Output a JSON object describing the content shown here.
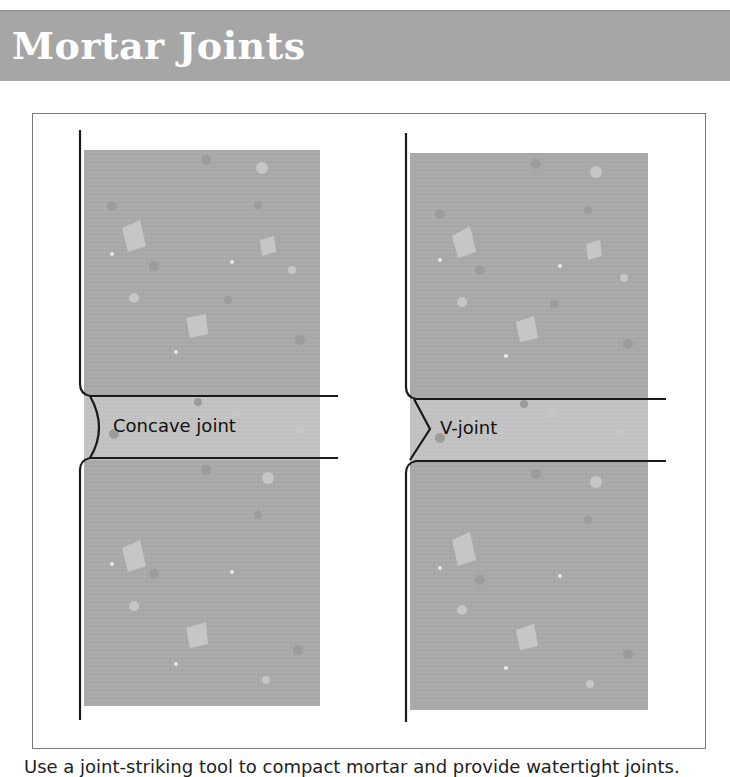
{
  "header": {
    "title": "Mortar Joints"
  },
  "diagram": {
    "joints": [
      {
        "label": "Concave joint",
        "shape": "concave"
      },
      {
        "label": "V-joint",
        "shape": "v"
      }
    ],
    "colors": {
      "brick": "#a9a9a9",
      "mortar": "#c4c4c4",
      "speckle_light": "#c8c8c8",
      "speckle_dark": "#9a9a9a",
      "line": "#1a1a1a",
      "title_band": "#a6a6a6"
    }
  },
  "caption": "Use a joint-striking tool to compact mortar and provide watertight joints."
}
